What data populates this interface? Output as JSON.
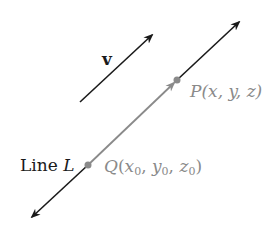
{
  "diagram": {
    "colors": {
      "line": "#1a1a1a",
      "position_vector": "#8a8a8a",
      "point": "#8a8a8a",
      "label_gray": "#8a8a8a",
      "label_black": "#1a1a1a"
    },
    "vector_v": {
      "label": "v",
      "from": [
        80,
        102
      ],
      "to": [
        152,
        35
      ]
    },
    "line_L": {
      "label_prefix": "Line ",
      "label_var": "L",
      "from": [
        32,
        217
      ],
      "to": [
        239,
        22
      ]
    },
    "point_Q": {
      "name": "Q",
      "coord_open": "(",
      "x": "x",
      "y": "y",
      "z": "z",
      "sub": "0",
      "sep": ", ",
      "coord_close": ")",
      "pos": [
        88,
        165
      ]
    },
    "point_P": {
      "name": "P",
      "coords": "(x, y, z)",
      "pos": [
        177,
        80
      ]
    },
    "segment_QP": {
      "from": [
        88,
        165
      ],
      "to": [
        177,
        80
      ]
    }
  }
}
